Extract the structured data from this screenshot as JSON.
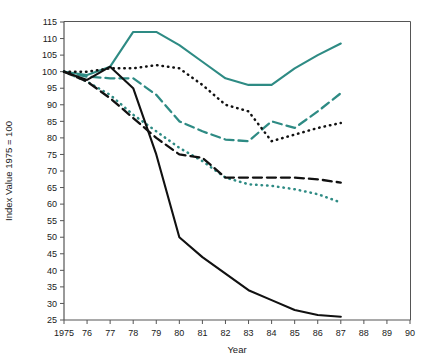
{
  "chart_data": {
    "type": "line",
    "title": "",
    "xlabel": "Year",
    "ylabel": "Index Value 1975 = 100",
    "xlim": [
      1975,
      1990
    ],
    "ylim": [
      25,
      115
    ],
    "grid": false,
    "legend": "none",
    "xtick_labels": [
      "1975",
      "76",
      "77",
      "78",
      "79",
      "80",
      "81",
      "82",
      "83",
      "84",
      "85",
      "86",
      "87",
      "88",
      "89",
      "90"
    ],
    "xticks": [
      1975,
      1976,
      1977,
      1978,
      1979,
      1980,
      1981,
      1982,
      1983,
      1984,
      1985,
      1986,
      1987,
      1988,
      1989,
      1990
    ],
    "ytick_labels": [
      "25",
      "30",
      "35",
      "40",
      "45",
      "50",
      "55",
      "60",
      "65",
      "70",
      "75",
      "80",
      "85",
      "90",
      "95",
      "100",
      "105",
      "110",
      "115"
    ],
    "yticks": [
      25,
      30,
      35,
      40,
      45,
      50,
      55,
      60,
      65,
      70,
      75,
      80,
      85,
      90,
      95,
      100,
      105,
      110,
      115
    ],
    "colors": {
      "teal": "#2e8b84",
      "black": "#111111",
      "axis": "#555555"
    },
    "series": [
      {
        "name": "teal-solid",
        "color": "#2e8b84",
        "style": "solid",
        "x": [
          1975,
          1976,
          1977,
          1978,
          1979,
          1980,
          1981,
          1982,
          1983,
          1984,
          1985,
          1986,
          1987
        ],
        "values": [
          100,
          99,
          101.5,
          112,
          112,
          108,
          103,
          98,
          96,
          96,
          101,
          105,
          108.5
        ]
      },
      {
        "name": "teal-dashed",
        "color": "#2e8b84",
        "style": "dashed",
        "x": [
          1975,
          1976,
          1977,
          1978,
          1979,
          1980,
          1981,
          1982,
          1983,
          1984,
          1985,
          1986,
          1987
        ],
        "values": [
          100,
          98.5,
          98,
          98,
          93,
          85,
          82,
          79.5,
          79,
          85,
          83,
          88,
          93.5
        ]
      },
      {
        "name": "teal-dotted",
        "color": "#2e8b84",
        "style": "dotted",
        "x": [
          1975,
          1976,
          1977,
          1978,
          1979,
          1980,
          1981,
          1982,
          1983,
          1984,
          1985,
          1986,
          1987
        ],
        "values": [
          100,
          97,
          93,
          87,
          82,
          77,
          73,
          68,
          66,
          65.5,
          64.5,
          63,
          60.5
        ]
      },
      {
        "name": "black-solid",
        "color": "#111111",
        "style": "solid",
        "x": [
          1975,
          1976,
          1977,
          1978,
          1979,
          1980,
          1981,
          1982,
          1983,
          1984,
          1985,
          1986,
          1987
        ],
        "values": [
          100,
          97.5,
          101.5,
          95,
          75,
          50,
          44,
          39,
          34,
          31,
          28,
          26.5,
          26
        ]
      },
      {
        "name": "black-dashed",
        "color": "#111111",
        "style": "dashed",
        "x": [
          1975,
          1976,
          1977,
          1978,
          1979,
          1980,
          1981,
          1982,
          1983,
          1984,
          1985,
          1986,
          1987
        ],
        "values": [
          100,
          97,
          92,
          86,
          80,
          75,
          74,
          68,
          68,
          68,
          68,
          67.5,
          66.5
        ]
      },
      {
        "name": "black-dotted",
        "color": "#111111",
        "style": "dotted",
        "x": [
          1975,
          1976,
          1977,
          1978,
          1979,
          1980,
          1981,
          1982,
          1983,
          1984,
          1985,
          1986,
          1987
        ],
        "values": [
          100,
          100,
          101,
          101,
          102,
          101,
          96,
          90,
          88,
          79,
          81,
          83,
          84.5
        ]
      }
    ]
  }
}
